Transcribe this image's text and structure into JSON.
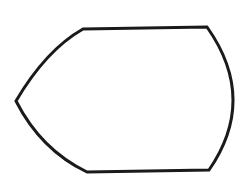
{
  "diagram": {
    "type": "outline-shape",
    "stroke_color": "#1a1a1a",
    "fill_color": "#ffffff",
    "background": "#ffffff",
    "stroke_width": 3,
    "vertices": {
      "left_point": [
        16,
        101
      ],
      "top_left": [
        83,
        29
      ],
      "top_right": [
        207,
        27
      ],
      "bottom_right": [
        209,
        170
      ],
      "bottom_left": [
        87,
        172
      ],
      "right_arc_extreme": [
        232,
        100
      ]
    }
  }
}
